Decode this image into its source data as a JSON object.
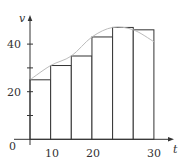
{
  "chart_data": {
    "type": "bar",
    "title": "",
    "xlabel": "t",
    "ylabel": "v",
    "categories": [
      "0-5",
      "5-10",
      "10-15",
      "15-20",
      "20-25",
      "25-30"
    ],
    "bar_left_edges": [
      0,
      5,
      10,
      15,
      20,
      25
    ],
    "bar_width": 5,
    "values": [
      25,
      31,
      35,
      43,
      47,
      46
    ],
    "curve": {
      "x": [
        0,
        5,
        10,
        15,
        20,
        25,
        30
      ],
      "y": [
        25,
        31,
        35,
        43,
        47,
        46,
        41
      ]
    },
    "xlim": [
      0,
      30
    ],
    "ylim": [
      0,
      50
    ],
    "x_ticks": [
      0,
      10,
      20,
      30
    ],
    "y_ticks": [
      10,
      20,
      30,
      40
    ],
    "y_tick_labels": [
      "20",
      "40"
    ],
    "x_tick_labels": [
      "0",
      "10",
      "20",
      "30"
    ],
    "grid": false,
    "legend": null,
    "colors": {
      "bars_fill": "#ffffff",
      "bars_stroke": "#333333",
      "curve": "#bbbbbb",
      "axis": "#333333"
    }
  },
  "labels": {
    "y_axis": "v",
    "x_axis": "t",
    "origin": "0",
    "x10": "10",
    "x20": "20",
    "x30": "30",
    "y20": "20",
    "y40": "40"
  }
}
